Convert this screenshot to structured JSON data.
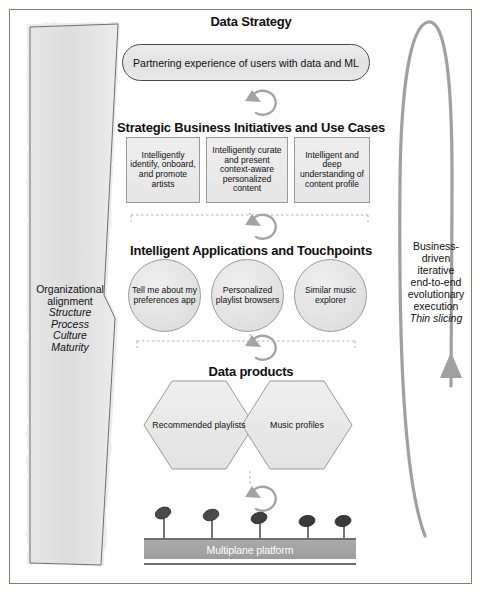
{
  "diagram": {
    "colors": {
      "shape_fill": "#e8e8e8",
      "shape_stroke": "#9a9a9a",
      "arrow_gray": "#9b9b9b",
      "platform_fill": "#a2a2a2",
      "platform_text": "#ffffff",
      "frame_border": "#7d7d7d",
      "text": "#111111"
    },
    "left_panel": {
      "name": "organizational-alignment",
      "line1": "Organizational",
      "line2": "alignment",
      "items": [
        "Structure",
        "Process",
        "Culture",
        "Maturity"
      ]
    },
    "right_panel": {
      "name": "business-driven-loop",
      "lines": [
        "Business-",
        "driven",
        "iterative",
        "end-to-end",
        "evolutionary",
        "execution"
      ],
      "italic_line": "Thin slicing"
    },
    "layers": [
      {
        "key": "strategy",
        "heading": "Data Strategy",
        "pill": "Partnering experience of users with data and ML"
      },
      {
        "key": "initiatives",
        "heading": "Strategic Business Initiatives and Use Cases",
        "boxes": [
          "Intelligently identify, onboard, and promote artists",
          "Intelligently curate and present context-aware personalized content",
          "Intelligent and deep understanding of content profile"
        ]
      },
      {
        "key": "applications",
        "heading": "Intelligent Applications and Touchpoints",
        "circles": [
          "Tell me about my preferences app",
          "Personalized playlist browsers",
          "Similar music explorer"
        ]
      },
      {
        "key": "products",
        "heading": "Data products",
        "hexagons": [
          "Recommended playlists",
          "Music profiles"
        ]
      },
      {
        "key": "platform",
        "label": "Multiplane platform",
        "pin_count": 5
      }
    ]
  }
}
